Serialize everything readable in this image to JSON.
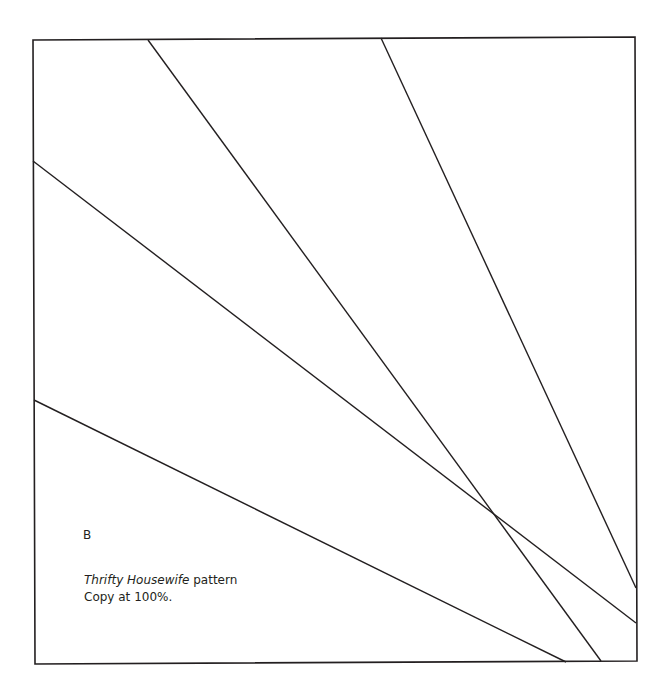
{
  "pattern": {
    "label": "B",
    "caption_italic": "Thrifty Housewife",
    "caption_rest": " pattern",
    "instruction": "Copy at 100%."
  },
  "colors": {
    "line": "#231f20",
    "background": "#ffffff"
  }
}
